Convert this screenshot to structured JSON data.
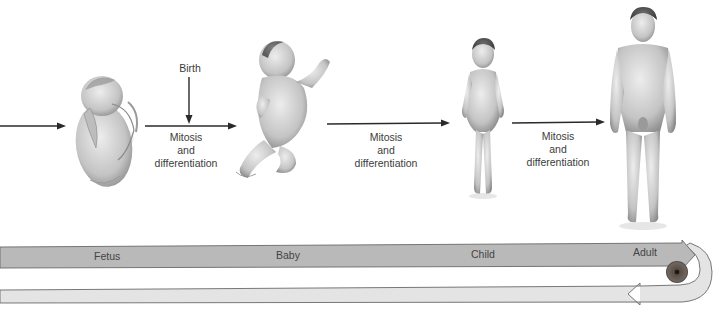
{
  "figure": {
    "stages": [
      {
        "name": "Fetus"
      },
      {
        "name": "Baby"
      },
      {
        "name": "Child"
      },
      {
        "name": "Adult"
      }
    ],
    "transitions": [
      {
        "line1": "Mitosis",
        "line2": "and",
        "line3": "differentiation"
      },
      {
        "line1": "Mitosis",
        "line2": "and",
        "line3": "differentiation"
      },
      {
        "line1": "Mitosis",
        "line2": "and",
        "line3": "differentiation"
      }
    ],
    "event_label": "Birth",
    "colors": {
      "upper_band": "#b9b9b9",
      "lower_band": "#e4e4e4",
      "band_outline": "#6a6a6a",
      "arrow": "#2a2a2a",
      "egg_cell": "#5a4a40",
      "skin_light": "#e2e2e2",
      "skin_shade": "#9a9a9a"
    }
  }
}
